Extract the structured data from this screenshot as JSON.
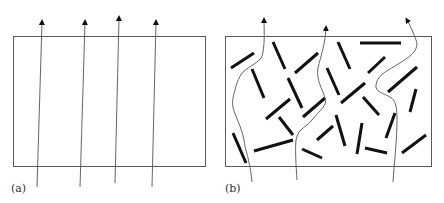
{
  "figure": {
    "colors": {
      "frame": "#5a5a5a",
      "path": "#555555",
      "arrowhead": "#111111",
      "platelet": "#111111",
      "background": "#ffffff"
    },
    "panels": [
      {
        "id": "a",
        "label": "(a)",
        "description": "Unfilled matrix: straight diffusion paths",
        "frame": {
          "x": 13,
          "y": 36,
          "w": 192,
          "h": 130
        },
        "paths": [
          {
            "type": "straight",
            "from": [
              37,
              187
            ],
            "to": [
              42,
              22
            ]
          },
          {
            "type": "straight",
            "from": [
              80,
              187
            ],
            "to": [
              85,
              22
            ]
          },
          {
            "type": "straight",
            "from": [
              115,
              183
            ],
            "to": [
              119,
              18
            ]
          },
          {
            "type": "straight",
            "from": [
              152,
              187
            ],
            "to": [
              156,
              22
            ]
          }
        ]
      },
      {
        "id": "b",
        "label": "(b)",
        "description": "Platelet-filled matrix: tortuous diffusion paths",
        "frame": {
          "x": 225,
          "y": 36,
          "w": 206,
          "h": 130
        },
        "paths": [
          {
            "type": "curve",
            "d": "M252,182 C250,160 245,150 244,140 C240,120 230,110 233,98 C236,85 238,78 243,72 C252,64 262,62 263,52 C265,40 264,30 264,20"
          },
          {
            "type": "curve",
            "d": "M297,180 C296,165 295,150 296,140 C298,128 308,126 312,120 C320,110 328,105 325,98 C322,88 316,80 318,68 C321,55 325,45 326,28"
          },
          {
            "type": "curve",
            "d": "M393,182 C394,165 397,140 397,120 C397,108 396,100 390,97 C383,93 375,92 376,85 C377,76 385,72 395,66 C410,57 420,50 416,40 C413,32 410,25 407,20"
          }
        ],
        "platelets": [
          [
            231,
            68,
            254,
            53
          ],
          [
            273,
            42,
            285,
            69
          ],
          [
            295,
            73,
            318,
            53
          ],
          [
            338,
            42,
            350,
            69
          ],
          [
            360,
            43,
            401,
            43
          ],
          [
            368,
            73,
            385,
            57
          ],
          [
            252,
            69,
            264,
            98
          ],
          [
            288,
            78,
            302,
            108
          ],
          [
            327,
            68,
            339,
            95
          ],
          [
            388,
            92,
            417,
            67
          ],
          [
            266,
            119,
            290,
            99
          ],
          [
            303,
            117,
            325,
            98
          ],
          [
            341,
            103,
            365,
            83
          ],
          [
            363,
            97,
            379,
            115
          ],
          [
            416,
            89,
            410,
            112
          ],
          [
            279,
            117,
            293,
            135
          ],
          [
            317,
            140,
            333,
            126
          ],
          [
            336,
            115,
            345,
            146
          ],
          [
            395,
            113,
            386,
            138
          ],
          [
            362,
            123,
            357,
            154
          ],
          [
            233,
            133,
            246,
            163
          ],
          [
            254,
            151,
            293,
            140
          ],
          [
            302,
            149,
            322,
            158
          ],
          [
            365,
            148,
            387,
            153
          ],
          [
            402,
            153,
            426,
            135
          ]
        ]
      }
    ]
  }
}
